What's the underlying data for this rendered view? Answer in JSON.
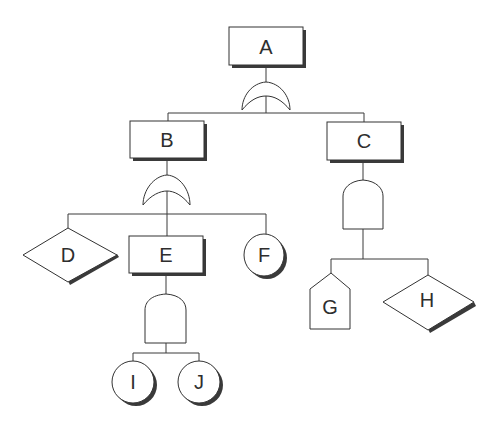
{
  "diagram": {
    "type": "fault-tree",
    "colors": {
      "line": "#3a3a3a",
      "shadow": "#3a3a3a",
      "fill": "#ffffff",
      "text": "#2e2e2e"
    },
    "nodes": {
      "A": {
        "label": "A",
        "kind": "event-rectangle",
        "gate": "OR"
      },
      "B": {
        "label": "B",
        "kind": "event-rectangle",
        "gate": "OR"
      },
      "C": {
        "label": "C",
        "kind": "event-rectangle",
        "gate": "AND"
      },
      "D": {
        "label": "D",
        "kind": "undeveloped-event-diamond"
      },
      "E": {
        "label": "E",
        "kind": "event-rectangle",
        "gate": "AND"
      },
      "F": {
        "label": "F",
        "kind": "basic-event-circle"
      },
      "G": {
        "label": "G",
        "kind": "house-event"
      },
      "H": {
        "label": "H",
        "kind": "undeveloped-event-diamond"
      },
      "I": {
        "label": "I",
        "kind": "basic-event-circle"
      },
      "J": {
        "label": "J",
        "kind": "basic-event-circle"
      }
    },
    "edges": [
      [
        "A",
        "B"
      ],
      [
        "A",
        "C"
      ],
      [
        "B",
        "D"
      ],
      [
        "B",
        "E"
      ],
      [
        "B",
        "F"
      ],
      [
        "C",
        "G"
      ],
      [
        "C",
        "H"
      ],
      [
        "E",
        "I"
      ],
      [
        "E",
        "J"
      ]
    ]
  }
}
